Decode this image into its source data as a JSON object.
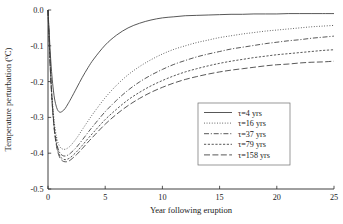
{
  "chart_data": {
    "type": "line",
    "title": "",
    "xlabel": "Year following eruption",
    "ylabel": "Temperature perturbation (oC)",
    "ylabel_main": "Temperature perturbation (",
    "ylabel_sup": "o",
    "ylabel_tail": "C)",
    "xlim": [
      0,
      25
    ],
    "ylim": [
      -0.5,
      0.0
    ],
    "xticks": [
      0,
      5,
      10,
      15,
      20,
      25
    ],
    "yticks": [
      0.0,
      -0.1,
      -0.2,
      -0.3,
      -0.4,
      -0.5
    ],
    "xtick_labels": [
      "0",
      "5",
      "10",
      "15",
      "20",
      "25"
    ],
    "ytick_labels": [
      "0.0",
      "-0.1",
      "-0.2",
      "-0.3",
      "-0.4",
      "-0.5"
    ],
    "grid": false,
    "legend_position": "lower right",
    "line_color": "#3a3a3a",
    "axis_color": "#2b2b2b",
    "x": [
      0,
      0.25,
      0.5,
      0.75,
      1,
      1.25,
      1.5,
      1.75,
      2,
      2.5,
      3,
      3.5,
      4,
      5,
      6,
      7,
      8,
      9,
      10,
      11,
      12,
      13,
      14,
      15,
      16,
      17,
      18,
      19,
      20,
      21,
      22,
      23,
      24,
      25
    ],
    "series": [
      {
        "name": "tau=4 yrs",
        "label": "τ=4 yrs",
        "tau": 4,
        "style": "solid",
        "dash": "none",
        "values": [
          0.0,
          -0.145,
          -0.232,
          -0.272,
          -0.285,
          -0.283,
          -0.275,
          -0.262,
          -0.248,
          -0.218,
          -0.188,
          -0.161,
          -0.137,
          -0.098,
          -0.07,
          -0.05,
          -0.037,
          -0.028,
          -0.022,
          -0.019,
          -0.016,
          -0.015,
          -0.014,
          -0.013,
          -0.012,
          -0.012,
          -0.011,
          -0.011,
          -0.011,
          -0.01,
          -0.01,
          -0.01,
          -0.01,
          -0.01
        ]
      },
      {
        "name": "tau=16 yrs",
        "label": "τ=16 yrs",
        "tau": 16,
        "style": "dotted",
        "dash": "0.9 1.7",
        "values": [
          0.0,
          -0.185,
          -0.298,
          -0.355,
          -0.38,
          -0.388,
          -0.389,
          -0.385,
          -0.378,
          -0.358,
          -0.334,
          -0.31,
          -0.287,
          -0.245,
          -0.21,
          -0.181,
          -0.158,
          -0.139,
          -0.123,
          -0.11,
          -0.1,
          -0.091,
          -0.084,
          -0.077,
          -0.072,
          -0.067,
          -0.063,
          -0.059,
          -0.056,
          -0.053,
          -0.05,
          -0.047,
          -0.045,
          -0.043
        ]
      },
      {
        "name": "tau=37 yrs",
        "label": "τ=37 yrs",
        "tau": 37,
        "style": "dashdot",
        "dash": "5 1.8 1.1 1.8",
        "values": [
          0.0,
          -0.192,
          -0.31,
          -0.37,
          -0.397,
          -0.406,
          -0.408,
          -0.405,
          -0.399,
          -0.383,
          -0.363,
          -0.342,
          -0.322,
          -0.284,
          -0.252,
          -0.224,
          -0.201,
          -0.182,
          -0.166,
          -0.152,
          -0.141,
          -0.131,
          -0.123,
          -0.116,
          -0.109,
          -0.104,
          -0.099,
          -0.094,
          -0.09,
          -0.086,
          -0.083,
          -0.079,
          -0.076,
          -0.073
        ]
      },
      {
        "name": "tau=79 yrs",
        "label": "τ=79 yrs",
        "tau": 79,
        "style": "dashed-short",
        "dash": "2.2 1.6",
        "values": [
          0.0,
          -0.195,
          -0.315,
          -0.377,
          -0.405,
          -0.415,
          -0.418,
          -0.416,
          -0.411,
          -0.396,
          -0.378,
          -0.359,
          -0.341,
          -0.306,
          -0.277,
          -0.251,
          -0.23,
          -0.212,
          -0.197,
          -0.184,
          -0.173,
          -0.164,
          -0.156,
          -0.149,
          -0.143,
          -0.138,
          -0.133,
          -0.129,
          -0.125,
          -0.122,
          -0.119,
          -0.116,
          -0.113,
          -0.111
        ]
      },
      {
        "name": "tau=158 yrs",
        "label": "τ=158 yrs",
        "tau": 158,
        "style": "longdash",
        "dash": "6 2.4",
        "values": [
          0.0,
          -0.197,
          -0.318,
          -0.381,
          -0.41,
          -0.421,
          -0.424,
          -0.423,
          -0.418,
          -0.404,
          -0.387,
          -0.369,
          -0.352,
          -0.319,
          -0.291,
          -0.267,
          -0.247,
          -0.23,
          -0.216,
          -0.204,
          -0.194,
          -0.186,
          -0.179,
          -0.173,
          -0.168,
          -0.164,
          -0.16,
          -0.156,
          -0.153,
          -0.151,
          -0.148,
          -0.146,
          -0.145,
          -0.143
        ]
      }
    ]
  }
}
